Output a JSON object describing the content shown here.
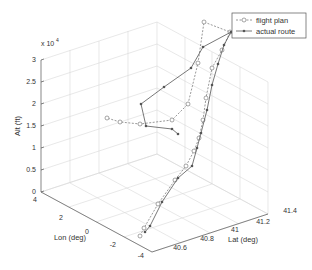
{
  "chart_data": {
    "type": "line3d",
    "title": "",
    "xlabel": "Lat (deg)",
    "ylabel": "Lon (deg)",
    "zlabel": "Alt (ft)",
    "z_exponent_label": "x 10",
    "z_exponent_power": "4",
    "xlim": [
      40.5,
      41.4
    ],
    "ylim": [
      -4,
      4
    ],
    "zlim": [
      0,
      30000
    ],
    "x_ticks": [
      "40.6",
      "40.8",
      "41",
      "41.2",
      "41.4"
    ],
    "y_ticks": [
      "-4",
      "-2",
      "0",
      "2",
      "4"
    ],
    "z_ticks": [
      "0",
      "0.5",
      "1",
      "1.5",
      "2",
      "2.5",
      "3"
    ],
    "grid": true,
    "legend_position": "northeast",
    "legend": [
      "flight plan",
      "actual route"
    ],
    "series": [
      {
        "name": "flight plan",
        "style": "dashed",
        "marker": "circle-open",
        "color": "#7f7f7f",
        "points_2d": [
          [
            140,
            236
          ],
          [
            144,
            228
          ],
          [
            158,
            204
          ],
          [
            175,
            180
          ],
          [
            186,
            166
          ],
          [
            194,
            151
          ],
          [
            199,
            138
          ],
          [
            203,
            120
          ],
          [
            206,
            98
          ],
          [
            212,
            68
          ],
          [
            222,
            50
          ],
          [
            230,
            32
          ],
          [
            204,
            22
          ],
          [
            198,
            63
          ],
          [
            188,
            104
          ],
          [
            172,
            120
          ],
          [
            140,
            124
          ],
          [
            120,
            122
          ],
          [
            107,
            118
          ]
        ]
      },
      {
        "name": "actual route",
        "style": "solid",
        "marker": "asterisk",
        "color": "#555555",
        "points_2d": [
          [
            145,
            232
          ],
          [
            150,
            226
          ],
          [
            162,
            202
          ],
          [
            178,
            178
          ],
          [
            192,
            166
          ],
          [
            197,
            148
          ],
          [
            201,
            133
          ],
          [
            207,
            110
          ],
          [
            212,
            85
          ],
          [
            218,
            64
          ],
          [
            224,
            45
          ],
          [
            231,
            32
          ],
          [
            203,
            47
          ],
          [
            191,
            68
          ],
          [
            164,
            87
          ],
          [
            141,
            104
          ],
          [
            146,
            126
          ],
          [
            172,
            129
          ],
          [
            178,
            134
          ]
        ]
      }
    ]
  },
  "legend": {
    "items": [
      {
        "label": "flight plan"
      },
      {
        "label": "actual route"
      }
    ]
  }
}
